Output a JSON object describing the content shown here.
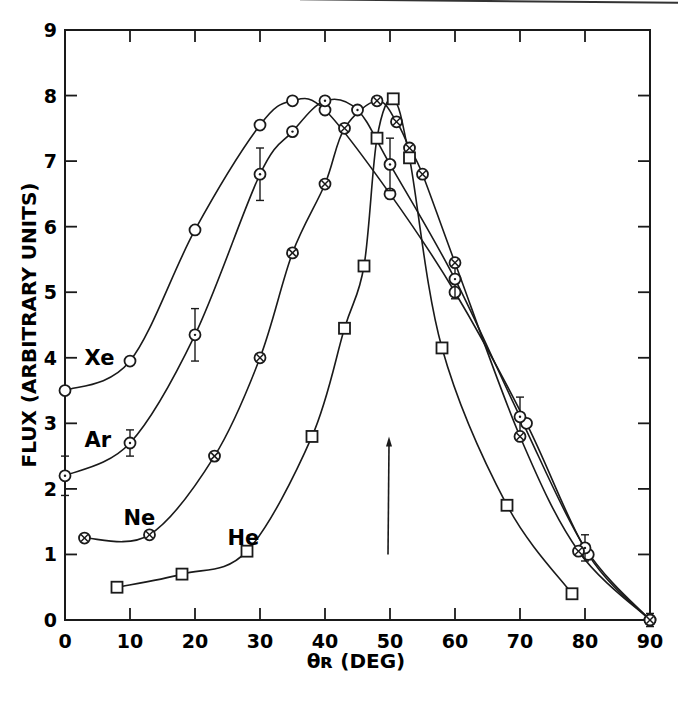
{
  "chart_data": {
    "type": "line",
    "title": "",
    "xlabel": "θr (DEG)",
    "ylabel": "FLUX (ARBITRARY UNITS)",
    "xlim": [
      0,
      90
    ],
    "ylim": [
      0,
      9
    ],
    "xticks": [
      0,
      10,
      20,
      30,
      40,
      50,
      60,
      70,
      80,
      90
    ],
    "yticks": [
      0,
      1,
      2,
      3,
      4,
      5,
      6,
      7,
      8,
      9
    ],
    "grid": false,
    "legend_position": "inline labels near curves",
    "annotations": [
      {
        "type": "arrow",
        "x": 50,
        "y_from": 1.0,
        "y_to": 2.8,
        "direction": "up"
      }
    ],
    "series": [
      {
        "name": "Xe",
        "marker": "open-circle",
        "label_pos": {
          "x": 3,
          "y": 4.0
        },
        "points": [
          [
            0,
            3.5
          ],
          [
            10,
            3.95
          ],
          [
            20,
            5.95
          ],
          [
            30,
            7.55
          ],
          [
            35,
            7.92
          ],
          [
            40,
            7.78
          ],
          [
            50,
            6.5
          ],
          [
            60,
            5.0
          ],
          [
            71,
            3.0
          ],
          [
            80.5,
            1.0
          ],
          [
            90,
            0
          ]
        ]
      },
      {
        "name": "Ar",
        "marker": "dotted-circle",
        "label_pos": {
          "x": 3,
          "y": 2.75
        },
        "points": [
          [
            0,
            2.2
          ],
          [
            10,
            2.7
          ],
          [
            20,
            4.35
          ],
          [
            30,
            6.8
          ],
          [
            35,
            7.45
          ],
          [
            40,
            7.92
          ],
          [
            45,
            7.78
          ],
          [
            50,
            6.95
          ],
          [
            60,
            5.2
          ],
          [
            70,
            3.1
          ],
          [
            80,
            1.1
          ],
          [
            90,
            0
          ]
        ],
        "error_bars": [
          [
            0,
            2.2,
            0.3
          ],
          [
            10,
            2.7,
            0.2
          ],
          [
            20,
            4.35,
            0.4
          ],
          [
            30,
            6.8,
            0.4
          ],
          [
            50,
            6.95,
            0.4
          ],
          [
            60,
            5.2,
            0.3
          ],
          [
            70,
            3.1,
            0.3
          ],
          [
            80,
            1.1,
            0.2
          ],
          [
            90,
            0,
            0.1
          ]
        ]
      },
      {
        "name": "Ne",
        "marker": "crossed-circle",
        "label_pos": {
          "x": 9,
          "y": 1.55
        },
        "points": [
          [
            3,
            1.25
          ],
          [
            13,
            1.3
          ],
          [
            23,
            2.5
          ],
          [
            30,
            4.0
          ],
          [
            35,
            5.6
          ],
          [
            40,
            6.65
          ],
          [
            43,
            7.5
          ],
          [
            48,
            7.92
          ],
          [
            51,
            7.6
          ],
          [
            53,
            7.2
          ],
          [
            55,
            6.8
          ],
          [
            60,
            5.45
          ],
          [
            70,
            2.8
          ],
          [
            79,
            1.05
          ],
          [
            90,
            0
          ]
        ]
      },
      {
        "name": "He",
        "marker": "open-square",
        "label_pos": {
          "x": 25,
          "y": 1.25
        },
        "points": [
          [
            8,
            0.5
          ],
          [
            18,
            0.7
          ],
          [
            28,
            1.05
          ],
          [
            38,
            2.8
          ],
          [
            43,
            4.45
          ],
          [
            46,
            5.4
          ],
          [
            48,
            7.35
          ],
          [
            50.5,
            7.95
          ],
          [
            53,
            7.05
          ],
          [
            58,
            4.15
          ],
          [
            68,
            1.75
          ],
          [
            78,
            0.4
          ]
        ]
      }
    ]
  }
}
